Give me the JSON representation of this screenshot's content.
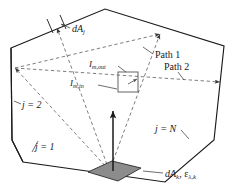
{
  "figure": {
    "name": "enclosure-radiation-diagram",
    "colors": {
      "outline": "#1a1a1a",
      "ray": "#6f6f6f",
      "plate_fill": "#8c8c8c",
      "leader": "#4a4a4a",
      "background": "#ffffff"
    }
  },
  "labels": {
    "dA_j": {
      "symbol": "dA",
      "subscript": "j"
    },
    "I_m_out": {
      "symbol": "I",
      "subscript": "m,out"
    },
    "I_m_in": {
      "symbol": "I",
      "subscript": "m,in"
    },
    "path_1": "Path 1",
    "path_2": "Path 2",
    "j_equals_2": "j = 2",
    "j_equals_1": "j = 1",
    "j_equals_N": "j = N",
    "dA_k_eps": {
      "symbol": "dA",
      "subscript": "k",
      "separator": ", ",
      "symbol2": "ε",
      "subscript2": "λ,k"
    }
  },
  "geometry": {
    "enclosure_vertices": "11,48 105,9 224,46 214,140 165,182 23,162 12,140",
    "plate_vertices": "88,172 112,161 141,168 118,181",
    "control_volume": {
      "x": 118,
      "y": 72,
      "width": 20,
      "height": 20
    }
  }
}
